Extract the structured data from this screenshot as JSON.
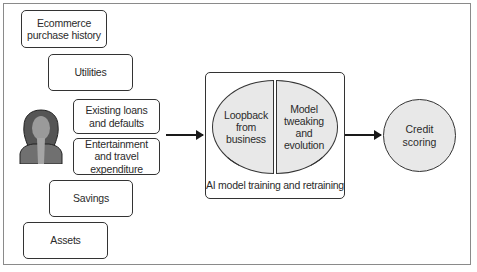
{
  "diagram": {
    "inputs": [
      {
        "label": "Ecommerce purchase history"
      },
      {
        "label": "Utilities"
      },
      {
        "label": "Existing loans and defaults"
      },
      {
        "label": "Entertainment and travel expenditure"
      },
      {
        "label": "Savings"
      },
      {
        "label": "Assets"
      }
    ],
    "person_icon": "person-icon",
    "ai_box": {
      "label": "AI model training and retraining",
      "left_half": "Loopback from business",
      "right_half": "Model tweaking and evolution"
    },
    "output": {
      "label": "Credit scoring"
    },
    "colors": {
      "border": "#333333",
      "shape_fill": "#e8e8e8",
      "arrow": "#1a1a1a",
      "person_hair": "#555555",
      "person_skin": "#9a9a9a"
    }
  }
}
